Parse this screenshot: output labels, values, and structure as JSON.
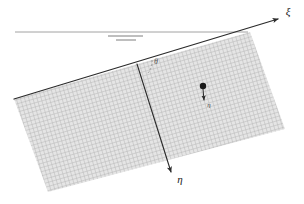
{
  "figure": {
    "type": "diagram",
    "background_color": "#ffffff",
    "line_color": "#2b2b2b",
    "reference_line_color": "#8a8a8a",
    "hatch_fill_color": "#c9c9c9",
    "hatch_line_color": "#b4b4b4",
    "labels": {
      "xi_axis": "ξ",
      "eta_axis": "η",
      "angle": "θ",
      "point_vector": "η"
    },
    "geometry": {
      "horizontal_reference_line": {
        "x1": 15,
        "y1": 32,
        "x2": 248,
        "y2": 32
      },
      "xi_axis": {
        "x1": 14,
        "y1": 99,
        "x2": 283,
        "y2": 17
      },
      "eta_axis": {
        "x1": 137,
        "y1": 64,
        "x2": 173,
        "y2": 178
      },
      "surface_corners": [
        {
          "x": 14,
          "y": 99
        },
        {
          "x": 250,
          "y": 32
        },
        {
          "x": 285,
          "y": 129
        },
        {
          "x": 48,
          "y": 192
        }
      ],
      "point_marker": {
        "x": 203,
        "y": 86,
        "radius": 3.2
      },
      "point_vector_tip": {
        "x": 204,
        "y": 105
      },
      "parallel_ticks": [
        {
          "x1": 108,
          "y1": 36,
          "x2": 143,
          "y2": 36
        },
        {
          "x1": 116,
          "y1": 40,
          "x2": 136,
          "y2": 40
        }
      ]
    },
    "annotations": {
      "xi_label_pos": {
        "x": 288,
        "y": 14
      },
      "eta_label_pos": {
        "x": 180,
        "y": 181
      },
      "angle_label_pos": {
        "x": 155,
        "y": 63
      },
      "point_label_pos": {
        "x": 208,
        "y": 106
      }
    }
  }
}
